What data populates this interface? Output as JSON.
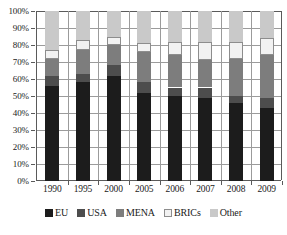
{
  "chart_data": {
    "type": "bar",
    "subtype": "stacked-100-percent",
    "title": "",
    "xlabel": "",
    "ylabel": "",
    "categories": [
      "1990",
      "1995",
      "2000",
      "2005",
      "2006",
      "2007",
      "2008",
      "2009"
    ],
    "series": [
      {
        "name": "EU",
        "color": "#1c1c1c",
        "values": [
          56,
          58,
          62,
          52,
          50,
          49,
          46,
          43
        ]
      },
      {
        "name": "USA",
        "color": "#4d4d4d",
        "values": [
          6,
          5,
          6,
          6,
          5,
          6,
          4,
          6
        ]
      },
      {
        "name": "MENA",
        "color": "#7d7d7d",
        "values": [
          10,
          14,
          12,
          18,
          19,
          16,
          22,
          25
        ]
      },
      {
        "name": "BRICs",
        "color": "#f2f2f2",
        "values": [
          5,
          6,
          5,
          5,
          8,
          11,
          10,
          10
        ]
      },
      {
        "name": "Other",
        "color": "#c9c9c9",
        "values": [
          23,
          17,
          15,
          19,
          18,
          18,
          18,
          16
        ]
      }
    ],
    "ylim": [
      0,
      100
    ],
    "ytick_labels": [
      "0%",
      "10%",
      "20%",
      "30%",
      "40%",
      "50%",
      "60%",
      "70%",
      "80%",
      "90%",
      "100%"
    ],
    "ytick_values": [
      0,
      10,
      20,
      30,
      40,
      50,
      60,
      70,
      80,
      90,
      100
    ],
    "grid": "horizontal-and-vertical",
    "legend_position": "bottom",
    "legend_entries": [
      "EU",
      "USA",
      "MENA",
      "BRICs",
      "Other"
    ]
  },
  "axis_colors": {
    "axis_line": "#5a5a5a",
    "gridline": "#9b9b9b",
    "text": "#1a1a1a",
    "background": "#ffffff"
  }
}
